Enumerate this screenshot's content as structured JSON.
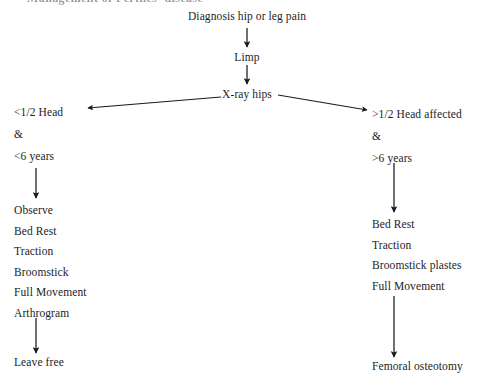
{
  "figure": {
    "type": "flowchart",
    "orientation": "top-down",
    "truncated_caption_above": "Management of Perthes' disease",
    "background_color": "#ffffff",
    "text_color": "#1d1d1d",
    "arrow_color": "#1a1a1a"
  },
  "nodes": {
    "start": "Diagnosis hip or leg pain",
    "symptom": "Limp",
    "investigation": "X-ray hips"
  },
  "branches": {
    "left": {
      "condition_lines": [
        "<1/2 Head",
        "&",
        "<6 years"
      ],
      "treatment": [
        "Observe",
        "Bed Rest",
        "Traction",
        "Broomstick",
        "Full Movement",
        "Arthrogram"
      ],
      "outcome": "Leave free"
    },
    "right": {
      "condition_lines": [
        ">1/2 Head affected",
        "&",
        ">6 years"
      ],
      "treatment": [
        "Bed Rest",
        "Traction",
        "Broomstick plastes",
        "Full Movement"
      ],
      "outcome": "Femoral osteotomy"
    }
  },
  "edges": [
    {
      "name": "start-to-limp",
      "from": "Diagnosis hip or leg pain",
      "to": "Limp",
      "style": "vertical-arrow"
    },
    {
      "name": "limp-to-xray",
      "from": "Limp",
      "to": "X-ray hips",
      "style": "vertical-arrow"
    },
    {
      "name": "xray-to-left-condition",
      "from": "X-ray hips",
      "to": "<1/2 Head & <6 years",
      "style": "diagonal-arrow-left"
    },
    {
      "name": "xray-to-right-condition",
      "from": "X-ray hips",
      "to": ">1/2 Head affected & >6 years",
      "style": "diagonal-arrow-right"
    },
    {
      "name": "left-condition-to-treatment",
      "from": "<6 years",
      "to": "Observe",
      "style": "vertical-arrow"
    },
    {
      "name": "left-treatment-to-outcome",
      "from": "Arthrogram",
      "to": "Leave free",
      "style": "vertical-arrow"
    },
    {
      "name": "right-condition-to-treatment",
      "from": ">6 years",
      "to": "Bed Rest",
      "style": "vertical-arrow"
    },
    {
      "name": "right-treatment-to-outcome",
      "from": "Full Movement",
      "to": "Femoral osteotomy",
      "style": "vertical-arrow"
    }
  ]
}
